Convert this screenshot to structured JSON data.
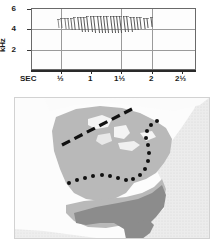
{
  "spectrogram": {
    "name": "sound-spectrogram",
    "y_axis": {
      "unit_label": "kHz",
      "ticks": [
        "6",
        "4",
        "2"
      ],
      "tick_values": [
        6,
        4,
        2
      ],
      "range": [
        0,
        6
      ]
    },
    "x_axis": {
      "name_label": "SEC",
      "ticks": [
        "½",
        "1",
        "1½",
        "2",
        "2½"
      ],
      "tick_values": [
        0.5,
        1.0,
        1.5,
        2.0,
        2.5
      ],
      "range": [
        0,
        2.75
      ]
    }
  },
  "chart_data": {
    "type": "scatter",
    "title": "",
    "xlabel": "SEC",
    "ylabel": "kHz",
    "xlim": [
      0,
      2.75
    ],
    "ylim": [
      0,
      6
    ],
    "grid": true,
    "legend": "none",
    "series": [
      {
        "name": "song-notes",
        "note_start_sec": 0.45,
        "note_end_sec": 2.05,
        "note_count": 29,
        "note_top_khz": 5.2,
        "note_bottom_khz": 3.6,
        "notes": [
          {
            "t": 0.45,
            "f_top": 4.9,
            "f_bottom": 4.0
          },
          {
            "t": 0.5,
            "f_top": 5.0,
            "f_bottom": 4.0
          },
          {
            "t": 0.56,
            "f_top": 5.0,
            "f_bottom": 3.9
          },
          {
            "t": 0.61,
            "f_top": 5.0,
            "f_bottom": 3.9
          },
          {
            "t": 0.67,
            "f_top": 5.0,
            "f_bottom": 3.8
          },
          {
            "t": 0.72,
            "f_top": 5.1,
            "f_bottom": 3.8
          },
          {
            "t": 0.78,
            "f_top": 5.1,
            "f_bottom": 3.8
          },
          {
            "t": 0.83,
            "f_top": 5.1,
            "f_bottom": 3.7
          },
          {
            "t": 0.89,
            "f_top": 5.1,
            "f_bottom": 3.7
          },
          {
            "t": 0.94,
            "f_top": 5.2,
            "f_bottom": 3.7
          },
          {
            "t": 1.0,
            "f_top": 5.2,
            "f_bottom": 3.7
          },
          {
            "t": 1.05,
            "f_top": 5.2,
            "f_bottom": 3.6
          },
          {
            "t": 1.11,
            "f_top": 5.2,
            "f_bottom": 3.6
          },
          {
            "t": 1.16,
            "f_top": 5.2,
            "f_bottom": 3.6
          },
          {
            "t": 1.22,
            "f_top": 5.2,
            "f_bottom": 3.6
          },
          {
            "t": 1.27,
            "f_top": 5.2,
            "f_bottom": 3.6
          },
          {
            "t": 1.33,
            "f_top": 5.2,
            "f_bottom": 3.6
          },
          {
            "t": 1.38,
            "f_top": 5.2,
            "f_bottom": 3.6
          },
          {
            "t": 1.44,
            "f_top": 5.2,
            "f_bottom": 3.6
          },
          {
            "t": 1.49,
            "f_top": 5.2,
            "f_bottom": 3.6
          },
          {
            "t": 1.55,
            "f_top": 5.2,
            "f_bottom": 3.7
          },
          {
            "t": 1.6,
            "f_top": 5.2,
            "f_bottom": 3.7
          },
          {
            "t": 1.66,
            "f_top": 5.1,
            "f_bottom": 3.7
          },
          {
            "t": 1.71,
            "f_top": 5.1,
            "f_bottom": 3.8
          },
          {
            "t": 1.77,
            "f_top": 5.1,
            "f_bottom": 3.8
          },
          {
            "t": 1.82,
            "f_top": 5.1,
            "f_bottom": 3.9
          },
          {
            "t": 1.88,
            "f_top": 5.0,
            "f_bottom": 3.9
          },
          {
            "t": 1.93,
            "f_top": 5.0,
            "f_bottom": 4.0
          },
          {
            "t": 2.0,
            "f_top": 5.1,
            "f_bottom": 4.1
          }
        ]
      }
    ]
  },
  "map": {
    "name": "range-map-eastern-north-america",
    "region": "Eastern North America",
    "colors": {
      "ocean": "#e4e4e4",
      "land_light": "#fafafa",
      "range_medium": "#b6b6b6",
      "range_dark": "#8c8c8c",
      "lakes": "#f2f2f2",
      "dashed_line": "#111111",
      "dotted_line": "#111111",
      "frame": "#d2d2d2"
    },
    "overlays": [
      {
        "style": "dashed",
        "name": "northern-boundary-dashed-line"
      },
      {
        "style": "dotted",
        "name": "southern-boundary-dotted-line"
      }
    ]
  }
}
